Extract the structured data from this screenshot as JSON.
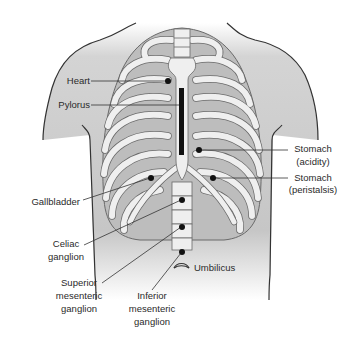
{
  "figure": {
    "colors": {
      "skin_shade": "#c8c8c8",
      "bone": "#efefef",
      "bone_outline": "#6a6a6a",
      "intercostal": "#bdbdbd",
      "outline": "#333333",
      "marker": "#111111",
      "leader": "#333333",
      "text": "#2a2a2a"
    }
  },
  "labels": {
    "heart": "Heart",
    "pylorus": "Pylorus",
    "stomach_acidity_1": "Stomach",
    "stomach_acidity_2": "(acidity)",
    "stomach_peristalsis_1": "Stomach",
    "stomach_peristalsis_2": "(peristalsis)",
    "gallbladder": "Gallbladder",
    "celiac_1": "Celiac",
    "celiac_2": "ganglion",
    "superior_1": "Superior",
    "superior_2": "mesenteric",
    "superior_3": "ganglion",
    "inferior_1": "Inferior",
    "inferior_2": "mesenteric",
    "inferior_3": "ganglion",
    "umbilicus": "Umbilicus"
  },
  "points": [
    {
      "name": "Heart",
      "x": 168,
      "y": 81
    },
    {
      "name": "Pylorus",
      "x": 182,
      "y": 105,
      "shape": "bar"
    },
    {
      "name": "Stomach (acidity)",
      "x": 199,
      "y": 150
    },
    {
      "name": "Gallbladder",
      "x": 151,
      "y": 178
    },
    {
      "name": "Stomach (peristalsis)",
      "x": 213,
      "y": 178
    },
    {
      "name": "Celiac ganglion",
      "x": 182,
      "y": 200
    },
    {
      "name": "Superior mesenteric ganglion",
      "x": 182,
      "y": 227
    },
    {
      "name": "Inferior mesenteric ganglion",
      "x": 182,
      "y": 252
    },
    {
      "name": "Umbilicus",
      "x": 180,
      "y": 265,
      "shape": "eye"
    }
  ]
}
